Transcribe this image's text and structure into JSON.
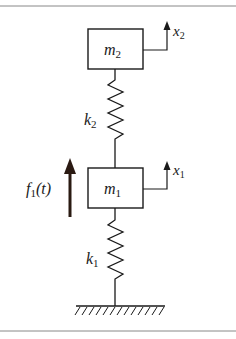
{
  "diagram": {
    "type": "two-degree-of-freedom spring-mass system",
    "masses": [
      {
        "id": "m2",
        "label": "m",
        "subscript": "2",
        "displacement": {
          "label": "x",
          "subscript": "2"
        }
      },
      {
        "id": "m1",
        "label": "m",
        "subscript": "1",
        "displacement": {
          "label": "x",
          "subscript": "1"
        }
      }
    ],
    "springs": [
      {
        "id": "k2",
        "label": "k",
        "subscript": "2",
        "connects": [
          "m2",
          "m1"
        ]
      },
      {
        "id": "k1",
        "label": "k",
        "subscript": "1",
        "connects": [
          "m1",
          "ground"
        ]
      }
    ],
    "force": {
      "label": "f",
      "subscript": "1",
      "argument": "(t)",
      "direction": "up",
      "applied_to": "m1"
    },
    "ground": {
      "label": "fixed support"
    },
    "colors": {
      "line": "#1a1a1a",
      "frame": "#888888",
      "background": "#ffffff"
    }
  }
}
